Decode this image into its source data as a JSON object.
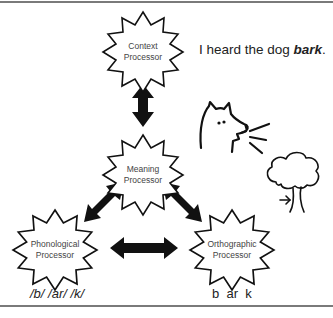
{
  "nodes": {
    "context": {
      "line1": "Context",
      "line2": "Processor"
    },
    "meaning": {
      "line1": "Meaning",
      "line2": "Processor"
    },
    "phonological": {
      "line1": "Phonological",
      "line2": "Processor"
    },
    "orthographic": {
      "line1": "Orthographic",
      "line2": "Processor"
    }
  },
  "sentence": {
    "prefix": "I heard the dog ",
    "emphasis": "bark",
    "suffix": "."
  },
  "captions": {
    "phonological": "/b/ /ar/ /k/",
    "orthographic": "b  ar  k"
  },
  "illustrations": [
    "dog-barking-icon",
    "tree-icon"
  ],
  "colors": {
    "stroke": "#111111",
    "arrow": "#111111",
    "text": "#444444",
    "rule": "#7a7a7a"
  }
}
